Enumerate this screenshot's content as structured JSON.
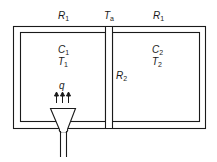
{
  "diagram": {
    "type": "thermal two-room schematic",
    "labels": {
      "r1_left": {
        "main": "R",
        "sub": "1"
      },
      "ta": {
        "main": "T",
        "sub": "a"
      },
      "r1_right": {
        "main": "R",
        "sub": "1"
      },
      "c1": {
        "main": "C",
        "sub": "1"
      },
      "t1": {
        "main": "T",
        "sub": "1"
      },
      "c2": {
        "main": "C",
        "sub": "2"
      },
      "t2": {
        "main": "T",
        "sub": "2"
      },
      "r2": {
        "main": "R",
        "sub": "2"
      },
      "q": {
        "main": "q"
      }
    },
    "colors": {
      "line": "#1a1a1a",
      "background": "#ffffff"
    }
  }
}
